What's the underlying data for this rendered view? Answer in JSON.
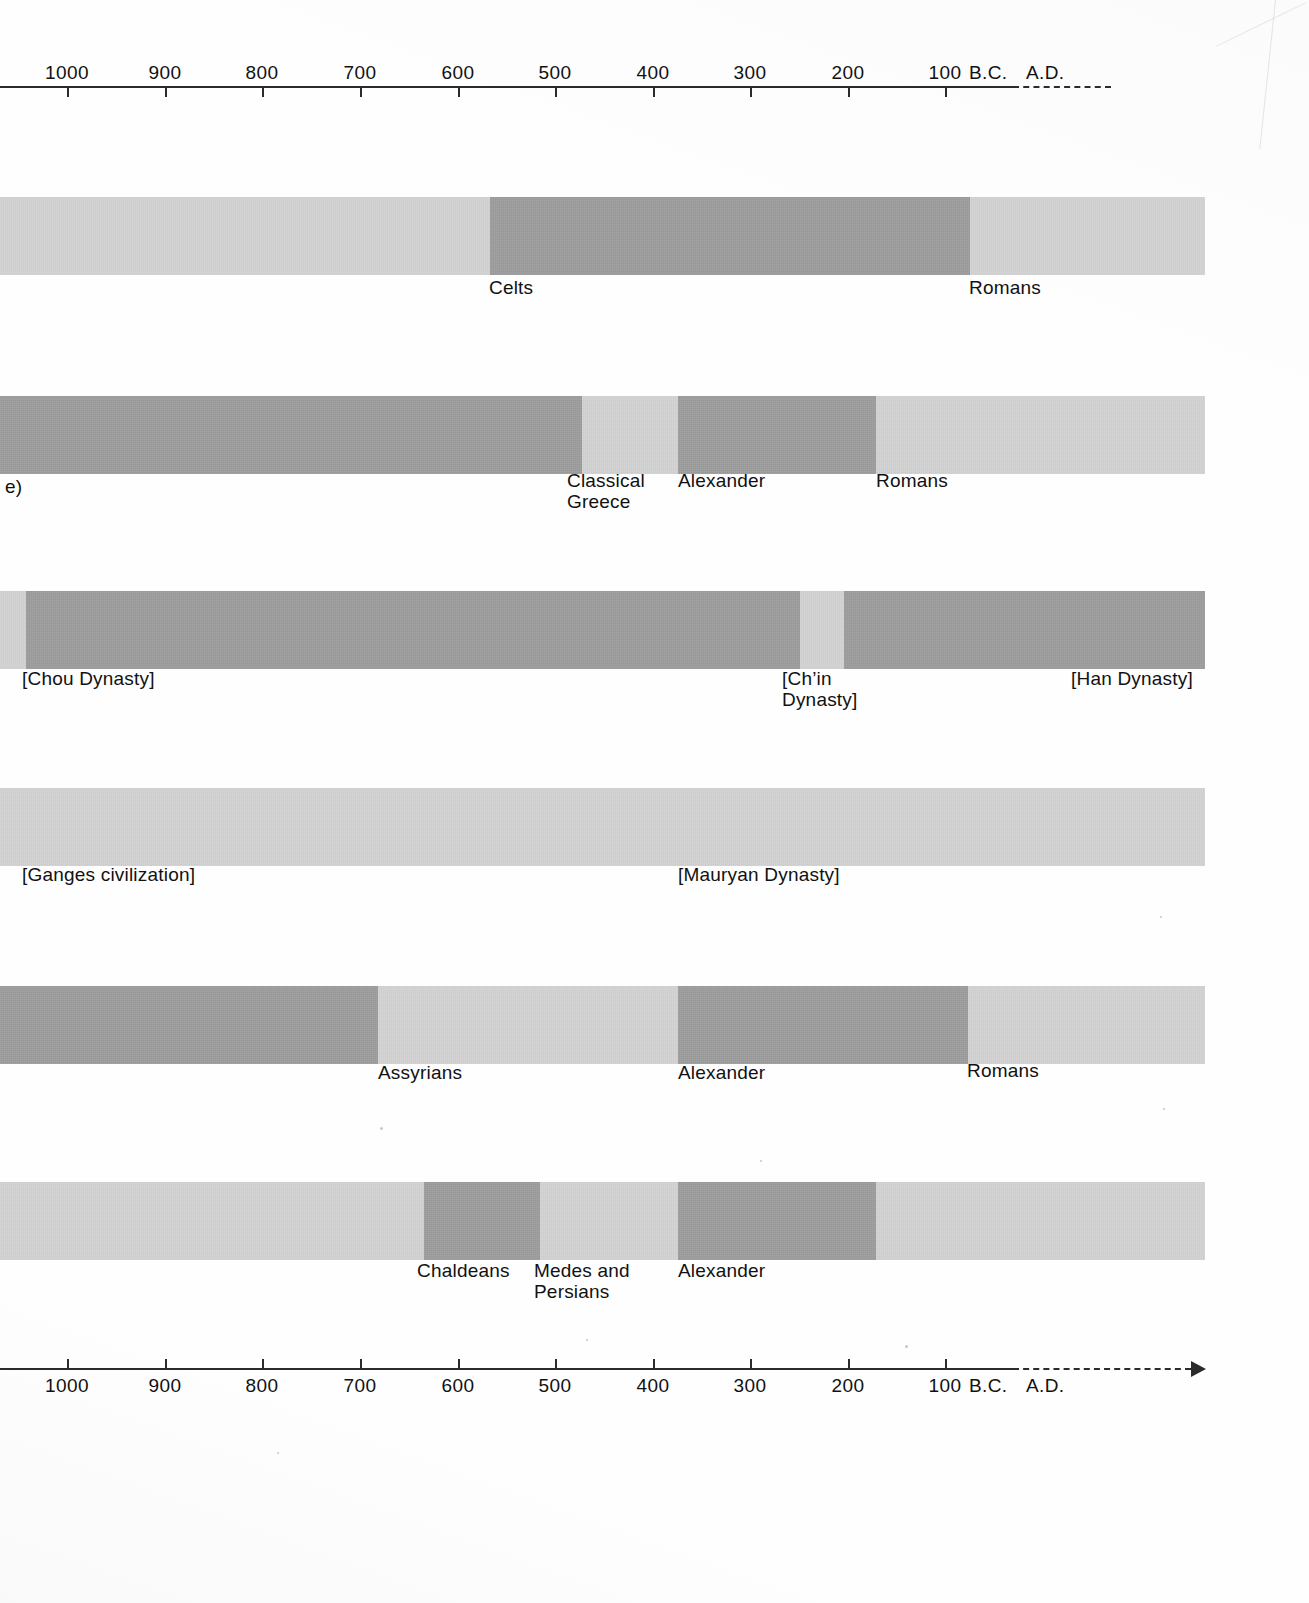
{
  "figure": {
    "label": "e)",
    "colors": {
      "light": "#d2d2d2",
      "dark": "#9c9c9c",
      "axis": "#2b2b2b"
    }
  },
  "axis": {
    "ticks": [
      {
        "label": "1000",
        "x": 67
      },
      {
        "label": "900",
        "x": 165
      },
      {
        "label": "800",
        "x": 262
      },
      {
        "label": "700",
        "x": 360
      },
      {
        "label": "600",
        "x": 458
      },
      {
        "label": "500",
        "x": 555
      },
      {
        "label": "400",
        "x": 653
      },
      {
        "label": "300",
        "x": 750
      },
      {
        "label": "200",
        "x": 848
      },
      {
        "label": "100",
        "x": 945
      }
    ],
    "era_before": "B.C.",
    "era_after": "A.D.",
    "era_before_x": 969,
    "era_after_x": 1026
  },
  "chart_data": {
    "type": "timeline",
    "title": "",
    "xlabel": "",
    "ylabel": "",
    "xlim": [
      1060,
      -60
    ],
    "x_unit": "years B.C. / A.D.",
    "grid": false,
    "legend": "none",
    "x_axis_ticks": [
      "1000",
      "900",
      "800",
      "700",
      "600",
      "500",
      "400",
      "300",
      "200",
      "100",
      "B.C.",
      "A.D."
    ],
    "rows": [
      {
        "name": "Western Europe",
        "segments": [
          {
            "label": "",
            "shade": "light",
            "x_start": 0,
            "x_end": 490
          },
          {
            "label": "Celts",
            "shade": "dark",
            "x_start": 490,
            "x_end": 970
          },
          {
            "label": "Romans",
            "shade": "light",
            "x_start": 970,
            "x_end": 1205
          }
        ]
      },
      {
        "name": "Greece",
        "segments": [
          {
            "label": "",
            "shade": "dark",
            "x_start": 0,
            "x_end": 582
          },
          {
            "label": "Classical\nGreece",
            "shade": "light",
            "x_start": 582,
            "x_end": 678
          },
          {
            "label": "Alexander",
            "shade": "dark",
            "x_start": 678,
            "x_end": 876
          },
          {
            "label": "Romans",
            "shade": "light",
            "x_start": 876,
            "x_end": 1205
          }
        ]
      },
      {
        "name": "China",
        "segments": [
          {
            "label": "",
            "shade": "light",
            "x_start": 0,
            "x_end": 26
          },
          {
            "label": "[Chou Dynasty]",
            "shade": "dark",
            "x_start": 26,
            "x_end": 800
          },
          {
            "label": "[Ch’in\nDynasty]",
            "shade": "light",
            "x_start": 800,
            "x_end": 844
          },
          {
            "label": "[Han Dynasty]",
            "shade": "dark",
            "x_start": 844,
            "x_end": 1205
          }
        ]
      },
      {
        "name": "India",
        "segments": [
          {
            "label": "[Ganges civilization]",
            "shade": "light",
            "x_start": 0,
            "x_end": 1205
          },
          {
            "label": "[Mauryan Dynasty]",
            "shade": "light",
            "x_start": 678,
            "x_end": 678
          }
        ]
      },
      {
        "name": "Mesopotamia / Near East",
        "segments": [
          {
            "label": "",
            "shade": "dark",
            "x_start": 0,
            "x_end": 378
          },
          {
            "label": "Assyrians",
            "shade": "light",
            "x_start": 378,
            "x_end": 678
          },
          {
            "label": "Alexander",
            "shade": "dark",
            "x_start": 678,
            "x_end": 968
          },
          {
            "label": "Romans",
            "shade": "light",
            "x_start": 968,
            "x_end": 1205
          }
        ]
      },
      {
        "name": "Babylonia / Persia",
        "segments": [
          {
            "label": "",
            "shade": "light",
            "x_start": 0,
            "x_end": 424
          },
          {
            "label": "Chaldeans",
            "shade": "dark",
            "x_start": 424,
            "x_end": 540
          },
          {
            "label": "Medes and\nPersians",
            "shade": "light",
            "x_start": 540,
            "x_end": 678
          },
          {
            "label": "Alexander",
            "shade": "dark",
            "x_start": 678,
            "x_end": 876
          },
          {
            "label": "",
            "shade": "light",
            "x_start": 876,
            "x_end": 1205
          }
        ]
      }
    ]
  },
  "bands": [
    {
      "top": 197,
      "segments": [
        {
          "x": 0,
          "w": 490,
          "shade": "light"
        },
        {
          "x": 490,
          "w": 480,
          "shade": "dark"
        },
        {
          "x": 970,
          "w": 235,
          "shade": "light"
        }
      ],
      "labels": [
        {
          "text": "Celts",
          "x": 489,
          "y": 277
        },
        {
          "text": "Romans",
          "x": 969,
          "y": 277
        }
      ]
    },
    {
      "top": 396,
      "segments": [
        {
          "x": 0,
          "w": 582,
          "shade": "dark"
        },
        {
          "x": 582,
          "w": 96,
          "shade": "light"
        },
        {
          "x": 678,
          "w": 198,
          "shade": "dark"
        },
        {
          "x": 876,
          "w": 329,
          "shade": "light"
        }
      ],
      "labels": [
        {
          "text": "e)",
          "x": 5,
          "y": 476
        },
        {
          "text": "Classical\nGreece",
          "x": 567,
          "y": 470
        },
        {
          "text": "Alexander",
          "x": 678,
          "y": 470
        },
        {
          "text": "Romans",
          "x": 876,
          "y": 470
        }
      ]
    },
    {
      "top": 591,
      "segments": [
        {
          "x": 0,
          "w": 26,
          "shade": "light"
        },
        {
          "x": 26,
          "w": 774,
          "shade": "dark"
        },
        {
          "x": 800,
          "w": 44,
          "shade": "light"
        },
        {
          "x": 844,
          "w": 361,
          "shade": "dark"
        }
      ],
      "labels": [
        {
          "text": "[Chou Dynasty]",
          "x": 22,
          "y": 668
        },
        {
          "text": "[Ch’in\nDynasty]",
          "x": 782,
          "y": 668
        },
        {
          "text": "[Han Dynasty]",
          "x": 1071,
          "y": 668
        }
      ]
    },
    {
      "top": 788,
      "segments": [
        {
          "x": 0,
          "w": 1205,
          "shade": "light"
        }
      ],
      "labels": [
        {
          "text": "[Ganges civilization]",
          "x": 22,
          "y": 864
        },
        {
          "text": "[Mauryan Dynasty]",
          "x": 678,
          "y": 864
        }
      ]
    },
    {
      "top": 986,
      "segments": [
        {
          "x": 0,
          "w": 378,
          "shade": "dark"
        },
        {
          "x": 378,
          "w": 300,
          "shade": "light"
        },
        {
          "x": 678,
          "w": 290,
          "shade": "dark"
        },
        {
          "x": 968,
          "w": 237,
          "shade": "light"
        }
      ],
      "labels": [
        {
          "text": "Assyrians",
          "x": 378,
          "y": 1062
        },
        {
          "text": "Alexander",
          "x": 678,
          "y": 1062
        },
        {
          "text": "Romans",
          "x": 967,
          "y": 1060
        }
      ]
    },
    {
      "top": 1182,
      "segments": [
        {
          "x": 0,
          "w": 424,
          "shade": "light"
        },
        {
          "x": 424,
          "w": 116,
          "shade": "dark"
        },
        {
          "x": 540,
          "w": 138,
          "shade": "light"
        },
        {
          "x": 678,
          "w": 198,
          "shade": "dark"
        },
        {
          "x": 876,
          "w": 329,
          "shade": "light"
        }
      ],
      "labels": [
        {
          "text": "Chaldeans",
          "x": 417,
          "y": 1260
        },
        {
          "text": "Medes and\nPersians",
          "x": 534,
          "y": 1260
        },
        {
          "text": "Alexander",
          "x": 678,
          "y": 1260
        }
      ]
    }
  ],
  "top_axis": {
    "y": 86,
    "label_y": 62,
    "rule_x": 0,
    "rule_w": 1013,
    "dash_x": 1013,
    "dash_w": 98,
    "tick_dir": "down",
    "arrow": false
  },
  "bottom_axis": {
    "y": 1368,
    "label_y": 1375,
    "rule_x": 0,
    "rule_w": 1013,
    "dash_x": 1013,
    "dash_w": 178,
    "tick_dir": "up",
    "arrow": true
  }
}
